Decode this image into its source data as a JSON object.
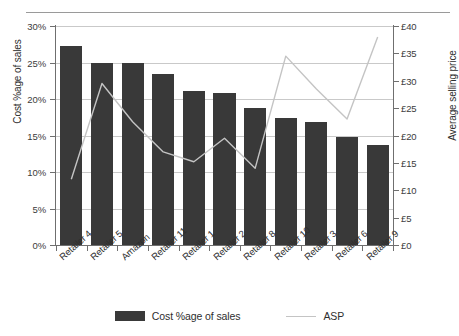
{
  "chart_data": {
    "type": "bar",
    "title": "",
    "xlabel": "",
    "ylabel": "Cost %age of sales",
    "y2label": "Average selling price",
    "categories": [
      "Retailer 4",
      "Retailer 5",
      "Amazon",
      "Retailer 11",
      "Retailer 1",
      "Retailer 2",
      "Retailer 8",
      "Retailer 10",
      "Retailer 3",
      "Retailer 6",
      "Retailer 9"
    ],
    "series": [
      {
        "name": "Cost %age of sales",
        "type": "bar",
        "axis": "left",
        "color": "#393939",
        "values": [
          27.3,
          25.0,
          25.0,
          23.4,
          21.1,
          20.8,
          18.8,
          17.4,
          16.8,
          14.8,
          13.7
        ]
      },
      {
        "name": "ASP",
        "type": "line",
        "axis": "right",
        "color": "#c4c4c4",
        "values": [
          12.0,
          29.5,
          22.5,
          17.0,
          15.2,
          19.5,
          14.0,
          34.5,
          28.5,
          23.0,
          38.0
        ]
      }
    ],
    "ylim": [
      0,
      30
    ],
    "yticks": [
      "0%",
      "5%",
      "10%",
      "15%",
      "20%",
      "25%",
      "30%"
    ],
    "ytick_values": [
      0,
      5,
      10,
      15,
      20,
      25,
      30
    ],
    "y2lim": [
      0,
      40
    ],
    "y2ticks": [
      "£0",
      "£5",
      "£10",
      "£15",
      "£20",
      "£25",
      "£30",
      "£35",
      "£40"
    ],
    "y2tick_values": [
      0,
      5,
      10,
      15,
      20,
      25,
      30,
      35,
      40
    ],
    "grid": true,
    "legend_position": "bottom",
    "legend": [
      "Cost %age of sales",
      "ASP"
    ]
  }
}
